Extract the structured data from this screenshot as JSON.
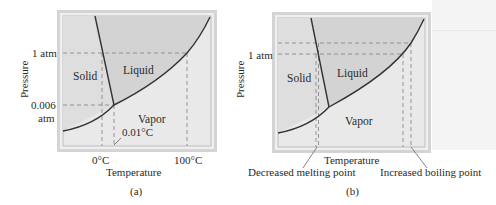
{
  "figure": {
    "panels": [
      {
        "id": "a",
        "caption": "(a)",
        "axes": {
          "xlabel": "Temperature",
          "ylabel": "Pressure",
          "x_ticks": [
            "0°C",
            "100°C"
          ],
          "y_ticks": [
            "1 atm",
            "0.006 atm"
          ],
          "y_tick_lines": [
            "0.006",
            "atm"
          ]
        },
        "regions": [
          "Solid",
          "Liquid",
          "Vapor"
        ],
        "annotations": [
          "0.01°C"
        ]
      },
      {
        "id": "b",
        "caption": "(b)",
        "axes": {
          "xlabel": "Temperature",
          "ylabel": "Pressure",
          "y_ticks": [
            "1 atm"
          ]
        },
        "regions": [
          "Solid",
          "Liquid",
          "Vapor"
        ],
        "annotations": [
          "Decreased melting point",
          "Increased boiling point"
        ]
      }
    ]
  },
  "colors": {
    "frame_outer": "#c8c8c8",
    "frame_inner_fill": "#e6e6e6",
    "liquid_fill": "#d2d2d2",
    "solid_fill": "#dcdcdc",
    "vapor_fill": "#e9e9e9",
    "curve": "#333333",
    "dashed": "#8a8a8a"
  }
}
